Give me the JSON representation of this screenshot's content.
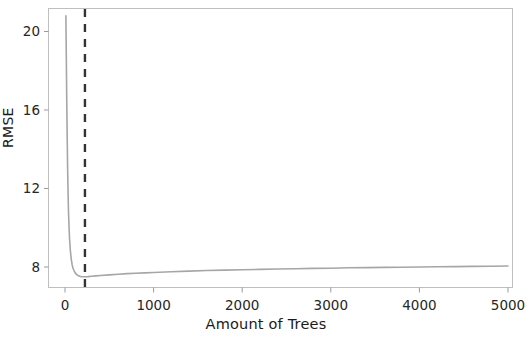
{
  "chart_data": {
    "type": "line",
    "title": "",
    "xlabel": "Amount of Trees",
    "ylabel": "RMSE",
    "xlim": [
      -150,
      5050
    ],
    "ylim": [
      7.0,
      21.2
    ],
    "xticks": [
      0,
      1000,
      2000,
      3000,
      4000,
      5000
    ],
    "xtick_labels": [
      "0",
      "1000",
      "2000",
      "3000",
      "4000",
      "5000"
    ],
    "yticks": [
      8,
      12,
      16,
      20
    ],
    "ytick_labels": [
      "8",
      "12",
      "16",
      "20"
    ],
    "grid": false,
    "legend": null,
    "series": [
      {
        "name": "RMSE vs number of trees",
        "color": "#a6a6a6",
        "x": [
          10,
          15,
          20,
          25,
          30,
          35,
          40,
          50,
          60,
          70,
          80,
          90,
          100,
          115,
          130,
          150,
          175,
          200,
          230,
          260,
          300,
          350,
          400,
          500,
          600,
          700,
          800,
          900,
          1000,
          1200,
          1400,
          1600,
          1800,
          2000,
          2200,
          2400,
          2600,
          2800,
          3000,
          3200,
          3400,
          3600,
          3800,
          4000,
          4200,
          4400,
          4600,
          4800,
          5000
        ],
        "y": [
          20.8,
          18.6,
          16.4,
          14.5,
          12.9,
          11.7,
          10.75,
          9.55,
          8.85,
          8.42,
          8.13,
          7.95,
          7.83,
          7.7,
          7.62,
          7.56,
          7.52,
          7.5,
          7.5,
          7.51,
          7.53,
          7.55,
          7.57,
          7.6,
          7.63,
          7.66,
          7.68,
          7.7,
          7.72,
          7.76,
          7.79,
          7.82,
          7.84,
          7.86,
          7.88,
          7.9,
          7.91,
          7.93,
          7.94,
          7.96,
          7.97,
          7.98,
          7.99,
          8.0,
          8.01,
          8.02,
          8.03,
          8.04,
          8.05
        ]
      }
    ],
    "annotations": [
      {
        "type": "vertical-dashed-line",
        "name": "optimal-trees-marker",
        "x": 225,
        "color": "#333333",
        "style": "dashed"
      }
    ]
  },
  "axes": {
    "frame_color": "#bfbfbf",
    "ytick_labels": [
      "20",
      "16",
      "12",
      "8"
    ],
    "xtick_labels": [
      "0",
      "1000",
      "2000",
      "3000",
      "4000",
      "5000"
    ],
    "ylabel": "RMSE",
    "xlabel": "Amount of Trees"
  }
}
